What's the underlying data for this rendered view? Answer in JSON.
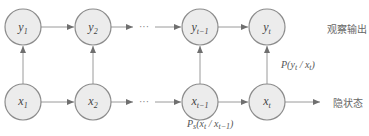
{
  "diagram": {
    "type": "hidden-markov-model",
    "observation_nodes": [
      {
        "id": "y1",
        "base": "y",
        "sub": "1",
        "cx": 23
      },
      {
        "id": "y2",
        "base": "y",
        "sub": "2",
        "cx": 93
      },
      {
        "id": "yt-1",
        "base": "y",
        "sub": "t−1",
        "cx": 200
      },
      {
        "id": "yt",
        "base": "y",
        "sub": "t",
        "cx": 267
      }
    ],
    "hidden_nodes": [
      {
        "id": "x1",
        "base": "x",
        "sub": "1",
        "cx": 23
      },
      {
        "id": "x2",
        "base": "x",
        "sub": "2",
        "cx": 93
      },
      {
        "id": "xt-1",
        "base": "x",
        "sub": "t−1",
        "cx": 200
      },
      {
        "id": "xt",
        "base": "x",
        "sub": "t",
        "cx": 267
      }
    ],
    "ellipsis": "···",
    "labels": {
      "observation_row": "观察输出",
      "hidden_row": "隐状态"
    },
    "emission_prob": "P(y_t / x_t)",
    "transition_prob": "P_s(x_t / x_{t−1})",
    "colors": {
      "node_fill": "#ececec",
      "node_stroke": "#8c8c8c",
      "edge": "#9a9a9a"
    }
  }
}
